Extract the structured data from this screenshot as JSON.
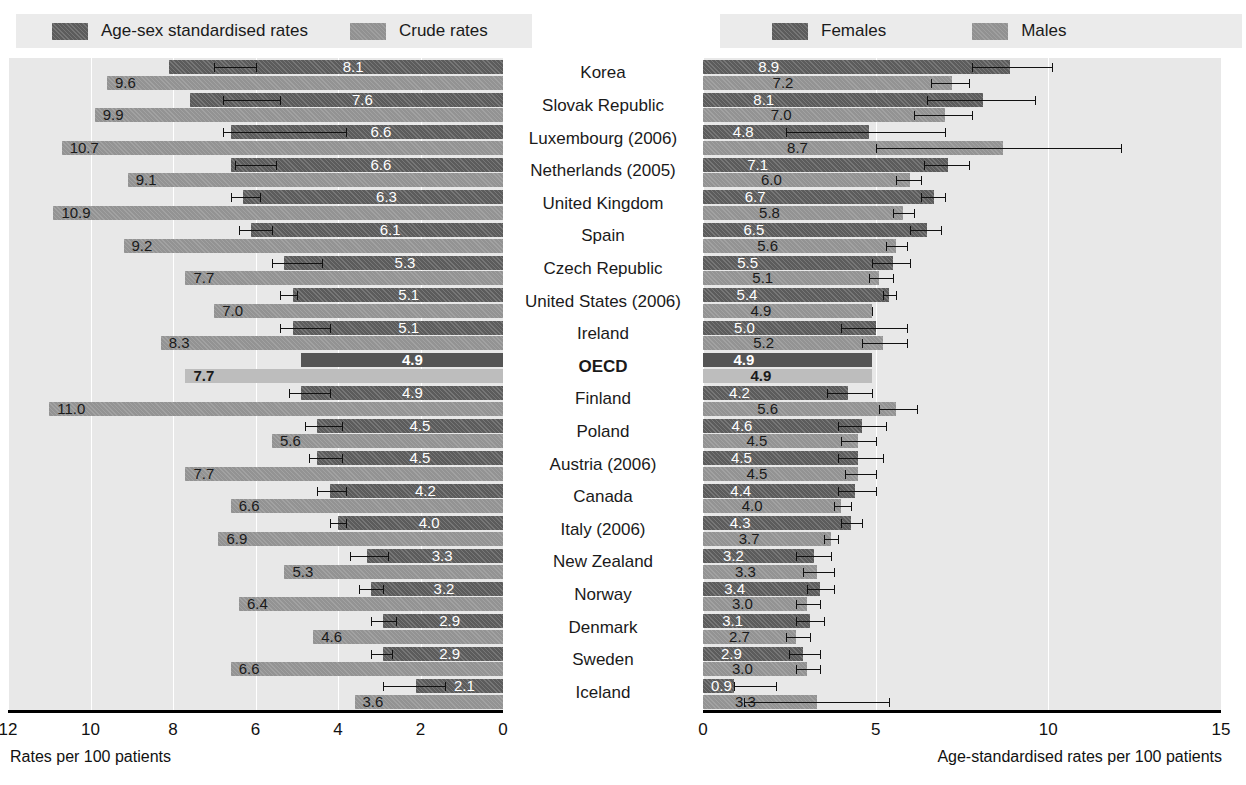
{
  "legends": {
    "left": [
      {
        "label": "Age-sex standardised rates",
        "swatch": "dark"
      },
      {
        "label": "Crude rates",
        "swatch": "light"
      }
    ],
    "right": [
      {
        "label": "Females",
        "swatch": "dark"
      },
      {
        "label": "Males",
        "swatch": "light"
      }
    ]
  },
  "countries": [
    "Korea",
    "Slovak Republic",
    "Luxembourg (2006)",
    "Netherlands (2005)",
    "United Kingdom",
    "Spain",
    "Czech Republic",
    "United States (2006)",
    "Ireland",
    "OECD",
    "Finland",
    "Poland",
    "Austria (2006)",
    "Canada",
    "Italy (2006)",
    "New Zealand",
    "Norway",
    "Denmark",
    "Sweden",
    "Iceland"
  ],
  "highlight_country": "OECD",
  "colors": {
    "dark": "#5c5c5c",
    "light": "#939393",
    "panel_bg": "#e8e8e8",
    "gridline": "#ffffff",
    "axis": "#000000",
    "legend_bg": "#ebebeb"
  },
  "chart_data": [
    {
      "type": "bar",
      "id": "left-chart",
      "title": "",
      "orientation": "horizontal",
      "direction": "rtl",
      "xlabel": "Rates per 100 patients",
      "ylabel": "",
      "xlim": [
        0,
        12
      ],
      "ticks": [
        12,
        10,
        8,
        6,
        4,
        2,
        0
      ],
      "grid": true,
      "legend_position": "top-left",
      "categories": [
        "Korea",
        "Slovak Republic",
        "Luxembourg (2006)",
        "Netherlands (2005)",
        "United Kingdom",
        "Spain",
        "Czech Republic",
        "United States (2006)",
        "Ireland",
        "OECD",
        "Finland",
        "Poland",
        "Austria (2006)",
        "Canada",
        "Italy (2006)",
        "New Zealand",
        "Norway",
        "Denmark",
        "Sweden",
        "Iceland"
      ],
      "series": [
        {
          "name": "Age-sex standardised rates",
          "style": "dark",
          "values": [
            8.1,
            7.6,
            6.6,
            6.6,
            6.3,
            6.1,
            5.3,
            5.1,
            5.1,
            4.9,
            4.9,
            4.5,
            4.5,
            4.2,
            4.0,
            3.3,
            3.2,
            2.9,
            2.9,
            2.1
          ],
          "ci_low": [
            6.0,
            5.4,
            3.8,
            5.5,
            5.9,
            5.6,
            4.4,
            5.0,
            4.2,
            null,
            4.2,
            3.9,
            3.9,
            3.8,
            3.8,
            2.8,
            2.9,
            2.6,
            2.7,
            1.4
          ],
          "ci_high": [
            7.0,
            6.8,
            6.8,
            6.5,
            6.6,
            6.4,
            5.6,
            5.4,
            5.4,
            null,
            5.2,
            4.8,
            4.7,
            4.5,
            4.2,
            3.7,
            3.5,
            3.2,
            3.2,
            2.9
          ]
        },
        {
          "name": "Crude rates",
          "style": "light",
          "values": [
            9.6,
            9.9,
            10.7,
            9.1,
            10.9,
            9.2,
            7.7,
            7.0,
            8.3,
            7.7,
            11.0,
            5.6,
            7.7,
            6.6,
            6.9,
            5.3,
            6.4,
            4.6,
            6.6,
            3.6
          ],
          "ci_low": [
            null,
            null,
            null,
            null,
            null,
            null,
            null,
            null,
            null,
            null,
            null,
            null,
            null,
            null,
            null,
            null,
            null,
            null,
            null,
            null
          ],
          "ci_high": [
            null,
            null,
            null,
            null,
            null,
            null,
            null,
            null,
            null,
            null,
            null,
            null,
            null,
            null,
            null,
            null,
            null,
            null,
            null,
            null
          ]
        }
      ]
    },
    {
      "type": "bar",
      "id": "right-chart",
      "title": "",
      "orientation": "horizontal",
      "direction": "ltr",
      "xlabel": "Age-standardised rates per 100 patients",
      "ylabel": "",
      "xlim": [
        0,
        15
      ],
      "ticks": [
        0,
        5,
        10,
        15
      ],
      "grid": true,
      "legend_position": "top-right",
      "categories": [
        "Korea",
        "Slovak Republic",
        "Luxembourg (2006)",
        "Netherlands (2005)",
        "United Kingdom",
        "Spain",
        "Czech Republic",
        "United States (2006)",
        "Ireland",
        "OECD",
        "Finland",
        "Poland",
        "Austria (2006)",
        "Canada",
        "Italy (2006)",
        "New Zealand",
        "Norway",
        "Denmark",
        "Sweden",
        "Iceland"
      ],
      "series": [
        {
          "name": "Females",
          "style": "dark",
          "values": [
            8.9,
            8.1,
            4.8,
            7.1,
            6.7,
            6.5,
            5.5,
            5.4,
            5.0,
            4.9,
            4.2,
            4.6,
            4.5,
            4.4,
            4.3,
            3.2,
            3.4,
            3.1,
            2.9,
            0.9
          ],
          "ci_low": [
            7.8,
            6.5,
            2.4,
            6.4,
            6.3,
            6.0,
            4.9,
            5.2,
            4.0,
            null,
            3.6,
            3.9,
            3.9,
            3.9,
            4.0,
            2.7,
            3.0,
            2.7,
            2.5,
            0.9
          ],
          "ci_high": [
            10.1,
            9.6,
            7.0,
            7.7,
            7.0,
            6.9,
            6.0,
            5.6,
            5.9,
            null,
            4.9,
            5.3,
            5.2,
            5.0,
            4.6,
            3.7,
            3.8,
            3.5,
            3.4,
            2.1
          ]
        },
        {
          "name": "Males",
          "style": "light",
          "values": [
            7.2,
            7.0,
            8.7,
            6.0,
            5.8,
            5.6,
            5.1,
            4.9,
            5.2,
            4.9,
            5.6,
            4.5,
            4.5,
            4.0,
            3.7,
            3.3,
            3.0,
            2.7,
            3.0,
            3.3
          ],
          "ci_low": [
            6.6,
            6.1,
            5.0,
            5.6,
            5.5,
            5.3,
            4.8,
            4.9,
            4.6,
            null,
            5.1,
            4.0,
            4.1,
            3.8,
            3.5,
            2.9,
            2.7,
            2.4,
            2.7,
            1.2
          ],
          "ci_high": [
            7.7,
            7.8,
            12.1,
            6.3,
            6.1,
            5.9,
            5.5,
            4.9,
            5.9,
            null,
            6.2,
            5.0,
            5.0,
            4.3,
            3.9,
            3.8,
            3.4,
            3.1,
            3.4,
            5.4
          ]
        }
      ]
    }
  ]
}
